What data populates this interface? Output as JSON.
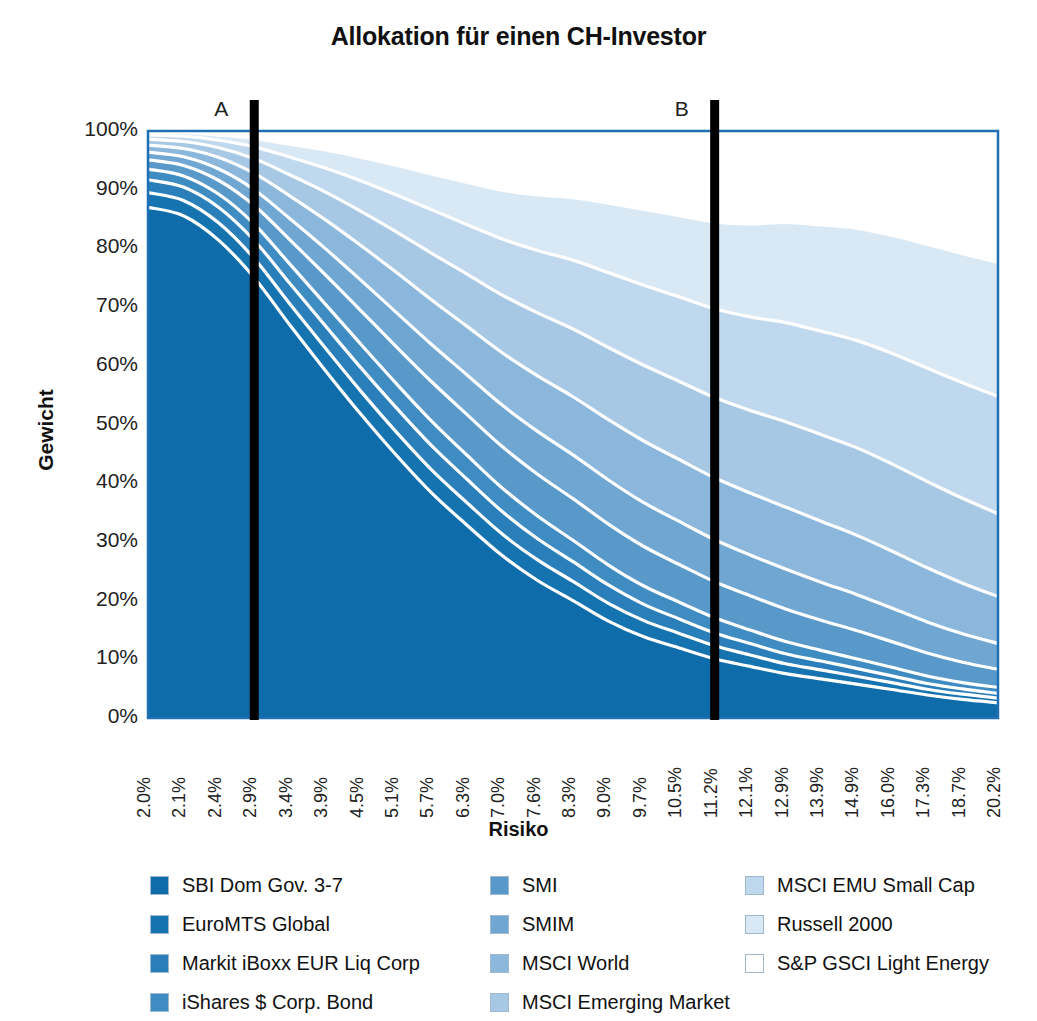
{
  "chart": {
    "title": "Allokation für einen CH-Investor",
    "y_axis_title": "Gewicht",
    "x_axis_title": "Risiko",
    "marker_a": "A",
    "marker_b": "B",
    "frame_color": "#1f6fb2"
  },
  "chart_data": {
    "type": "area",
    "title": "Allokation für einen CH-Investor",
    "xlabel": "Risiko",
    "ylabel": "Gewicht",
    "ylim": [
      0,
      100
    ],
    "grid": false,
    "legend_position": "bottom",
    "stacked": true,
    "stack_order": "bottom-to-top",
    "annotations": [
      {
        "label": "A",
        "x_category": "2.9%",
        "type": "vertical-line"
      },
      {
        "label": "B",
        "x_category": "11.2%",
        "type": "vertical-line"
      }
    ],
    "categories": [
      "2.0%",
      "2.1%",
      "2.4%",
      "2.9%",
      "3.4%",
      "3.9%",
      "4.5%",
      "5.1%",
      "5.7%",
      "6.3%",
      "7.0%",
      "7.6%",
      "8.3%",
      "9.0%",
      "9.7%",
      "10.5%",
      "11.2%",
      "12.1%",
      "12.9%",
      "13.9%",
      "14.9%",
      "16.0%",
      "17.3%",
      "18.7%",
      "20.2%"
    ],
    "ytick_labels": [
      "100%",
      "90%",
      "80%",
      "70%",
      "60%",
      "50%",
      "40%",
      "30%",
      "20%",
      "10%",
      "0%"
    ],
    "ytick_values": [
      100,
      90,
      80,
      70,
      60,
      50,
      40,
      30,
      20,
      10,
      0
    ],
    "series": [
      {
        "name": "SBI Dom Gov. 3-7",
        "color": "#0e6cab",
        "values": [
          87,
          86,
          83,
          78,
          71,
          64,
          57,
          50,
          43,
          37,
          31,
          26,
          22,
          18,
          15,
          13,
          11,
          9.5,
          8,
          7,
          6,
          5,
          4,
          3.2,
          2.6
        ]
      },
      {
        "name": "EuroMTS Global",
        "color": "#1573b0",
        "values": [
          2.5,
          2.6,
          3.0,
          3.4,
          3.8,
          4.1,
          4.3,
          4.4,
          4.4,
          4.3,
          4.1,
          3.9,
          3.6,
          3.3,
          3.0,
          2.7,
          2.4,
          2.1,
          1.8,
          1.6,
          1.4,
          1.2,
          1.0,
          0.9,
          0.8
        ]
      },
      {
        "name": "Markit iBoxx EUR Liq Corp",
        "color": "#2a7fba",
        "values": [
          2.2,
          2.3,
          2.7,
          3.2,
          3.7,
          4.1,
          4.4,
          4.6,
          4.6,
          4.5,
          4.3,
          4.0,
          3.7,
          3.4,
          3.0,
          2.7,
          2.4,
          2.1,
          1.8,
          1.6,
          1.4,
          1.2,
          1.0,
          0.9,
          0.8
        ]
      },
      {
        "name": "iShares $ Corp. Bond",
        "color": "#3f8cc2",
        "values": [
          1.8,
          1.9,
          2.3,
          2.9,
          3.5,
          4.0,
          4.4,
          4.6,
          4.7,
          4.6,
          4.5,
          4.3,
          4.0,
          3.7,
          3.4,
          3.1,
          2.8,
          2.5,
          2.2,
          1.9,
          1.7,
          1.5,
          1.3,
          1.1,
          1.0
        ]
      },
      {
        "name": "SMI",
        "color": "#5899ca",
        "values": [
          1.6,
          1.8,
          2.4,
          3.3,
          4.4,
          5.4,
          6.3,
          7.0,
          7.5,
          7.8,
          7.9,
          7.9,
          7.8,
          7.6,
          7.3,
          7.0,
          6.7,
          6.3,
          5.9,
          5.4,
          5.0,
          4.5,
          4.0,
          3.5,
          3.1
        ]
      },
      {
        "name": "SMIM",
        "color": "#70a7d2",
        "values": [
          1.3,
          1.5,
          2.0,
          2.8,
          3.8,
          4.8,
          5.7,
          6.5,
          7.1,
          7.6,
          7.9,
          8.1,
          8.2,
          8.2,
          8.1,
          8.0,
          7.8,
          7.5,
          7.2,
          6.8,
          6.4,
          5.9,
          5.4,
          4.9,
          4.4
        ]
      },
      {
        "name": "MSCI World",
        "color": "#8ab7db",
        "values": [
          1.2,
          1.4,
          2.0,
          2.9,
          4.1,
          5.3,
          6.5,
          7.6,
          8.5,
          9.3,
          10.0,
          10.5,
          10.9,
          11.2,
          11.4,
          11.5,
          11.5,
          11.4,
          11.2,
          10.9,
          10.5,
          10.0,
          9.4,
          8.7,
          8.0
        ]
      },
      {
        "name": "MSCI Emerging Market",
        "color": "#a6c8e4",
        "values": [
          1.0,
          1.2,
          1.7,
          2.6,
          3.8,
          5.1,
          6.4,
          7.7,
          8.9,
          10.0,
          11.0,
          11.9,
          12.7,
          13.4,
          14.0,
          14.5,
          14.9,
          15.2,
          15.4,
          15.5,
          15.5,
          15.3,
          15.0,
          14.6,
          14.1
        ]
      },
      {
        "name": "MSCI EMU Small Cap",
        "color": "#c0d8ed",
        "values": [
          0.7,
          0.9,
          1.3,
          2.1,
          3.2,
          4.4,
          5.7,
          7.0,
          8.3,
          9.5,
          10.7,
          11.8,
          12.9,
          13.9,
          14.8,
          15.7,
          16.5,
          17.2,
          17.9,
          18.5,
          19.0,
          19.4,
          19.7,
          19.9,
          20.0
        ]
      },
      {
        "name": "Russell 2000",
        "color": "#d9e8f5",
        "values": [
          0.5,
          0.6,
          0.9,
          1.5,
          2.3,
          3.3,
          4.4,
          5.6,
          6.8,
          8.1,
          9.3,
          10.5,
          11.7,
          12.9,
          14.0,
          15.1,
          16.1,
          17.1,
          18.1,
          19.0,
          19.9,
          20.7,
          21.5,
          22.2,
          22.8
        ]
      },
      {
        "name": "S&P GSCI Light Energy",
        "color": "#ffffff",
        "values": [
          0.2,
          0.3,
          0.7,
          1.3,
          2.4,
          3.5,
          4.9,
          6.5,
          8.2,
          9.8,
          11.3,
          12.1,
          12.5,
          13.4,
          14.5,
          15.7,
          16.9,
          17.1,
          16.5,
          16.8,
          17.2,
          18.3,
          19.7,
          21.1,
          22.4
        ]
      }
    ]
  },
  "legend": {
    "columns": [
      {
        "items": [
          {
            "label": "SBI Dom Gov. 3-7",
            "color": "#0e6cab"
          },
          {
            "label": "EuroMTS Global",
            "color": "#1573b0"
          },
          {
            "label": "Markit iBoxx EUR Liq Corp",
            "color": "#2a7fba"
          },
          {
            "label": "iShares $ Corp. Bond",
            "color": "#3f8cc2"
          }
        ]
      },
      {
        "items": [
          {
            "label": "SMI",
            "color": "#5899ca"
          },
          {
            "label": "SMIM",
            "color": "#70a7d2"
          },
          {
            "label": "MSCI World",
            "color": "#8ab7db"
          },
          {
            "label": "MSCI Emerging Market",
            "color": "#a6c8e4"
          }
        ]
      },
      {
        "items": [
          {
            "label": "MSCI EMU Small Cap",
            "color": "#c0d8ed"
          },
          {
            "label": "Russell 2000",
            "color": "#d9e8f5"
          },
          {
            "label": "S&P GSCI Light Energy",
            "color": "#ffffff"
          }
        ]
      }
    ]
  }
}
